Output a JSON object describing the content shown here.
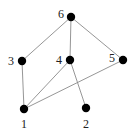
{
  "diagram": {
    "type": "graph",
    "nodes": [
      {
        "id": "1",
        "label": "1",
        "x": 24,
        "y": 109,
        "lx": 21,
        "ly": 128
      },
      {
        "id": "2",
        "label": "2",
        "x": 86,
        "y": 108,
        "lx": 83,
        "ly": 128
      },
      {
        "id": "3",
        "label": "3",
        "x": 22,
        "y": 61,
        "lx": 8,
        "ly": 65
      },
      {
        "id": "4",
        "label": "4",
        "x": 70,
        "y": 60,
        "lx": 56,
        "ly": 64
      },
      {
        "id": "5",
        "label": "5",
        "x": 123,
        "y": 60,
        "lx": 109,
        "ly": 62
      },
      {
        "id": "6",
        "label": "6",
        "x": 71,
        "y": 17,
        "lx": 58,
        "ly": 18
      }
    ],
    "edges": [
      {
        "from": "6",
        "to": "3"
      },
      {
        "from": "6",
        "to": "4"
      },
      {
        "from": "6",
        "to": "5"
      },
      {
        "from": "3",
        "to": "1"
      },
      {
        "from": "4",
        "to": "1"
      },
      {
        "from": "4",
        "to": "2"
      },
      {
        "from": "5",
        "to": "1"
      }
    ]
  }
}
